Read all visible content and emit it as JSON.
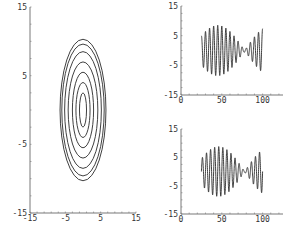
{
  "colors": {
    "line": "#2a2a2a",
    "axis": "#555555",
    "background": "#ffffff"
  },
  "chart_data": [
    {
      "id": "phase-portrait",
      "type": "line",
      "title": "",
      "xlabel": "",
      "ylabel": "",
      "xlim": [
        -15,
        15
      ],
      "ylim": [
        -15,
        15
      ],
      "grid": false,
      "x_ticks": [
        -15,
        -5,
        5,
        15
      ],
      "x_tick_labels": [
        "-15",
        "-5",
        "5",
        "15"
      ],
      "y_ticks": [
        15,
        5,
        -5,
        -15
      ],
      "y_tick_labels": [
        "15",
        "5",
        "-5",
        "-15"
      ],
      "description": "Nested closed elliptical orbits centered at origin",
      "ellipses": [
        {
          "rx": 1.0,
          "ry": 2.5
        },
        {
          "rx": 2.0,
          "ry": 4.0
        },
        {
          "rx": 3.0,
          "ry": 5.5
        },
        {
          "rx": 4.2,
          "ry": 7.0
        },
        {
          "rx": 5.2,
          "ry": 8.5
        },
        {
          "rx": 6.0,
          "ry": 9.6
        },
        {
          "rx": 6.5,
          "ry": 10.3
        }
      ],
      "frame": {
        "x0": 30,
        "x1": 136,
        "y0": 7,
        "y1": 213
      }
    },
    {
      "id": "time-series-top",
      "type": "line",
      "title": "",
      "xlabel": "",
      "ylabel": "",
      "xlim": [
        0,
        125
      ],
      "ylim": [
        -15,
        15
      ],
      "grid": false,
      "x_ticks": [
        0,
        50,
        100
      ],
      "x_tick_labels": [
        "0",
        "50",
        "100"
      ],
      "y_ticks": [
        15,
        5,
        -5,
        -15
      ],
      "y_tick_labels": [
        "15",
        "5",
        "-5",
        "-15"
      ],
      "description": "Beating oscillation from t=25 to t=100, amplitude ~9 max near t=45, node near t=78",
      "signal": {
        "t_start": 25,
        "t_end": 100,
        "amp": 8.5,
        "carrier_period": 5.0,
        "beat_period": 66,
        "beat_phase": 45,
        "offset": 0,
        "floor": 0.6,
        "start_phase": 0.25
      },
      "frame": {
        "x0": 181,
        "x1": 283,
        "y0": 6,
        "y1": 95
      }
    },
    {
      "id": "time-series-bottom",
      "type": "line",
      "title": "",
      "xlabel": "",
      "ylabel": "",
      "xlim": [
        0,
        125
      ],
      "ylim": [
        -15,
        15
      ],
      "grid": false,
      "x_ticks": [
        0,
        50,
        100
      ],
      "x_tick_labels": [
        "0",
        "50",
        "100"
      ],
      "y_ticks": [
        15,
        5,
        -5,
        -15
      ],
      "y_tick_labels": [
        "15",
        "5",
        "-5",
        "-15"
      ],
      "description": "Beating oscillation from t=25 to t=100, similar to top panel",
      "signal": {
        "t_start": 25,
        "t_end": 100,
        "amp": 8.8,
        "carrier_period": 5.0,
        "beat_period": 64,
        "beat_phase": 46,
        "offset": 0,
        "floor": 0.5,
        "start_phase": 0.0
      },
      "frame": {
        "x0": 181,
        "x1": 283,
        "y0": 129,
        "y1": 214
      }
    }
  ]
}
